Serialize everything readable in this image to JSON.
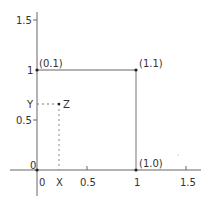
{
  "diagram": {
    "type": "unit-square-coordinate-diagram",
    "colors": {
      "axis": "#555555",
      "square": "#666666",
      "dashed": "#777777",
      "text": "#333333",
      "point": "#222222"
    },
    "axes": {
      "x_ticks": [
        {
          "value": 0,
          "label": "0"
        },
        {
          "value": 0.5,
          "label": "0.5"
        },
        {
          "value": 1,
          "label": "1"
        },
        {
          "value": 1.5,
          "label": "1.5"
        }
      ],
      "y_ticks": [
        {
          "value": 0,
          "label": "0"
        },
        {
          "value": 0.5,
          "label": "0.5"
        },
        {
          "value": 1,
          "label": "1"
        },
        {
          "value": 1.5,
          "label": "1.5"
        }
      ]
    },
    "square_vertices": [
      {
        "label": "(0.1)",
        "x": 0,
        "y": 1
      },
      {
        "label": "(1.1)",
        "x": 1,
        "y": 1
      },
      {
        "label": "(1.0)",
        "x": 1,
        "y": 0
      },
      {
        "label": "0",
        "x": 0,
        "y": 0
      }
    ],
    "point_z": {
      "label": "Z",
      "x": 0.22,
      "y": 0.66
    },
    "projection_labels": {
      "x": "X",
      "y": "Y"
    }
  }
}
